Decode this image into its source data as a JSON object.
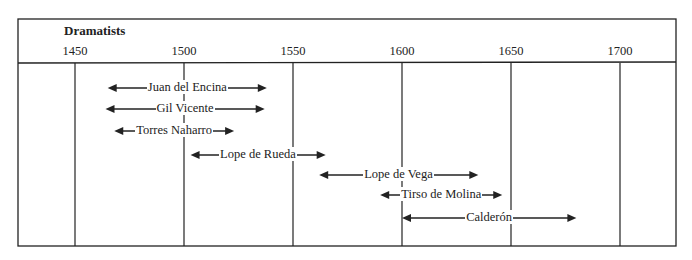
{
  "diagram": {
    "title": "Dramatists",
    "type": "timeline",
    "axis": {
      "ticks": [
        {
          "label": "1450",
          "year": 1450
        },
        {
          "label": "1500",
          "year": 1500
        },
        {
          "label": "1550",
          "year": 1550
        },
        {
          "label": "1600",
          "year": 1600
        },
        {
          "label": "1650",
          "year": 1650
        },
        {
          "label": "1700",
          "year": 1700
        }
      ]
    },
    "dramatists": [
      {
        "name": "Juan del Encina",
        "start": 1465,
        "end": 1538
      },
      {
        "name": "Gil Vicente",
        "start": 1464,
        "end": 1537
      },
      {
        "name": "Torres Naharro",
        "start": 1468,
        "end": 1523
      },
      {
        "name": "Lope de Rueda",
        "start": 1503,
        "end": 1565
      },
      {
        "name": "Lope de Vega",
        "start": 1562,
        "end": 1635
      },
      {
        "name": "Tirso de Molina",
        "start": 1590,
        "end": 1646
      },
      {
        "name": "Calderón",
        "start": 1600,
        "end": 1680
      }
    ]
  },
  "colors": {
    "line": "#222222",
    "background": "#ffffff"
  }
}
